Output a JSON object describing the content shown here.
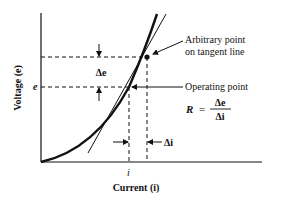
{
  "diagram": {
    "type": "voltage-current characteristic with tangent line",
    "axes": {
      "y_label": "Voltage (e)",
      "x_label": "Current (i)",
      "y_tick": "e",
      "x_tick": "i"
    },
    "annotations": {
      "delta_e": "Δe",
      "delta_i": "Δi",
      "arbitrary_point_line1": "Arbitrary point",
      "arbitrary_point_line2": "on tangent line",
      "operating_point": "Operating point",
      "formula_lhs": "R",
      "formula_eq": "=",
      "formula_num": "Δe",
      "formula_den": "Δi"
    },
    "colors": {
      "ink": "#111111",
      "background": "#ffffff"
    }
  }
}
